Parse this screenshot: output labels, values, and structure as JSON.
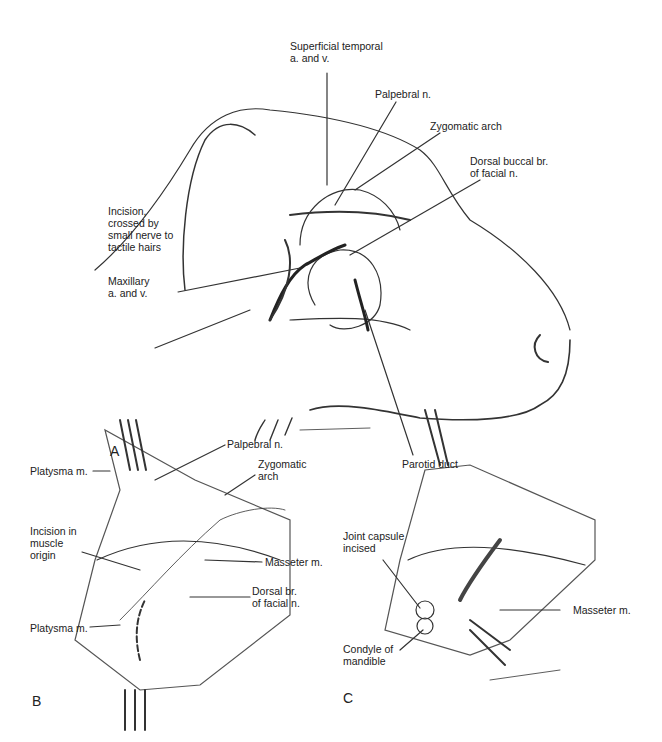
{
  "figure": {
    "panels": [
      {
        "letter": "A",
        "labels": {
          "superficial_temporal": "Superficial temporal\na. and v.",
          "palpebral": "Palpebral n.",
          "zygomatic_arch": "Zygomatic arch",
          "dorsal_buccal": "Dorsal buccal br.\nof facial n.",
          "incision": "Incision,\ncrossed by\nsmall nerve to\ntactile hairs",
          "maxillary": "Maxillary\na. and v.",
          "parotid_duct": "Parotid duct"
        }
      },
      {
        "letter": "B",
        "labels": {
          "palpebral": "Palpebral n.",
          "platysma_top": "Platysma m.",
          "zygomatic_arch": "Zygomatic\narch",
          "incision_muscle": "Incision in\nmuscle\norigin",
          "masseter": "Masseter m.",
          "dorsal_br": "Dorsal br.\nof facial n.",
          "platysma_bottom": "Platysma m."
        }
      },
      {
        "letter": "C",
        "labels": {
          "joint_capsule": "Joint capsule\nincised",
          "masseter": "Masseter m.",
          "condyle": "Condyle of\nmandible"
        }
      }
    ],
    "signature": "Giddings"
  }
}
